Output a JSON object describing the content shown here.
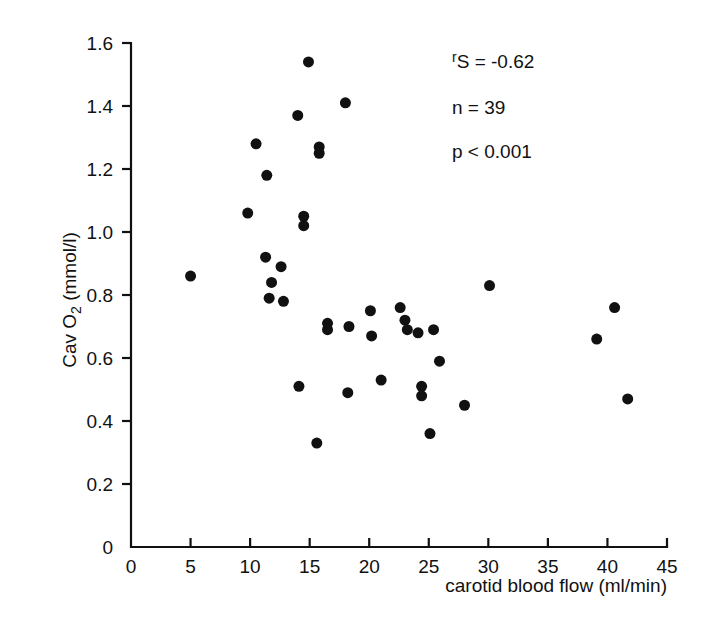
{
  "chart_data": {
    "type": "scatter",
    "title": "",
    "xlabel": "carotid blood flow (ml/min)",
    "ylabel": "Cav O2 (mmol/l)",
    "ylabel_parts": {
      "prefix": "Cav O",
      "subscript": "2",
      "suffix": " (mmol/l)"
    },
    "xlim": [
      0,
      45
    ],
    "ylim": [
      0,
      1.6
    ],
    "xticks": [
      0,
      5,
      10,
      15,
      20,
      25,
      30,
      35,
      40,
      45
    ],
    "xtick_labels": [
      "0",
      "5",
      "10",
      "15",
      "20",
      "25",
      "30",
      "35",
      "40",
      "45"
    ],
    "yticks": [
      0,
      0.2,
      0.4,
      0.6,
      0.8,
      1.0,
      1.2,
      1.4,
      1.6
    ],
    "ytick_labels": [
      "0",
      "0.2",
      "0.4",
      "0.6",
      "0.8",
      "1.0",
      "1.2",
      "1.4",
      "1.6"
    ],
    "grid": false,
    "legend": null,
    "marker": {
      "shape": "circle",
      "color": "#111111",
      "size_px": 11
    },
    "points": [
      {
        "x": 5.0,
        "y": 0.86
      },
      {
        "x": 9.8,
        "y": 1.06
      },
      {
        "x": 10.5,
        "y": 1.28
      },
      {
        "x": 11.3,
        "y": 0.92
      },
      {
        "x": 11.4,
        "y": 1.18
      },
      {
        "x": 11.8,
        "y": 0.84
      },
      {
        "x": 11.6,
        "y": 0.79
      },
      {
        "x": 12.6,
        "y": 0.89
      },
      {
        "x": 12.8,
        "y": 0.78
      },
      {
        "x": 14.0,
        "y": 1.37
      },
      {
        "x": 14.1,
        "y": 0.51
      },
      {
        "x": 14.5,
        "y": 1.05
      },
      {
        "x": 14.5,
        "y": 1.02
      },
      {
        "x": 14.9,
        "y": 1.54
      },
      {
        "x": 15.6,
        "y": 0.33
      },
      {
        "x": 15.8,
        "y": 1.27
      },
      {
        "x": 15.8,
        "y": 1.25
      },
      {
        "x": 16.5,
        "y": 0.71
      },
      {
        "x": 16.5,
        "y": 0.69
      },
      {
        "x": 18.0,
        "y": 1.41
      },
      {
        "x": 18.2,
        "y": 0.49
      },
      {
        "x": 18.3,
        "y": 0.7
      },
      {
        "x": 20.1,
        "y": 0.75
      },
      {
        "x": 20.2,
        "y": 0.67
      },
      {
        "x": 21.0,
        "y": 0.53
      },
      {
        "x": 22.6,
        "y": 0.76
      },
      {
        "x": 23.0,
        "y": 0.72
      },
      {
        "x": 23.2,
        "y": 0.69
      },
      {
        "x": 24.1,
        "y": 0.68
      },
      {
        "x": 24.4,
        "y": 0.51
      },
      {
        "x": 24.4,
        "y": 0.48
      },
      {
        "x": 25.4,
        "y": 0.69
      },
      {
        "x": 25.1,
        "y": 0.36
      },
      {
        "x": 25.9,
        "y": 0.59
      },
      {
        "x": 28.0,
        "y": 0.45
      },
      {
        "x": 30.1,
        "y": 0.83
      },
      {
        "x": 39.1,
        "y": 0.66
      },
      {
        "x": 40.6,
        "y": 0.76
      },
      {
        "x": 41.7,
        "y": 0.47
      }
    ],
    "annotations": [
      {
        "id": "spearman",
        "prefix": "r",
        "subscript": "S",
        "text": " = -0.62"
      },
      {
        "id": "sample-size",
        "text": "n = 39"
      },
      {
        "id": "p-value",
        "text": "p < 0.001"
      }
    ]
  }
}
